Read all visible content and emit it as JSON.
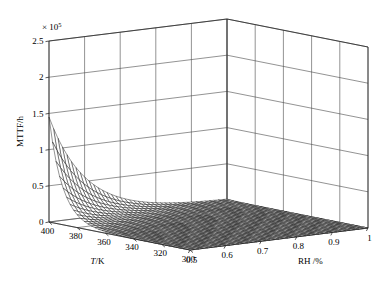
{
  "figure": {
    "title": "",
    "background_color": "#ffffff",
    "width": 382,
    "height": 296
  },
  "axes": {
    "z": {
      "label": "MTTF/h",
      "exponent_label": "× 10",
      "exponent_value": "5",
      "exponent_full": "× 10⁵",
      "ticks": [
        "0",
        "0.5",
        "1",
        "1.5",
        "2",
        "2.5"
      ],
      "tick_values": [
        0,
        0.5,
        1,
        1.5,
        2,
        2.5
      ],
      "range": [
        0,
        2.5
      ],
      "scale_factor": 100000
    },
    "x": {
      "label": "T/K",
      "ticks": [
        "400",
        "380",
        "360",
        "340",
        "320",
        "300"
      ],
      "tick_values": [
        400,
        380,
        360,
        340,
        320,
        300
      ],
      "range": [
        400,
        300
      ]
    },
    "y": {
      "label": "RH /%",
      "ticks": [
        "0.5",
        "0.6",
        "0.7",
        "0.8",
        "0.9",
        "1"
      ],
      "tick_values": [
        0.5,
        0.6,
        0.7,
        0.8,
        0.9,
        1
      ],
      "range": [
        0.5,
        1
      ]
    }
  },
  "chart_data": {
    "type": "surface",
    "title": "",
    "xlabel": "T/K",
    "ylabel": "RH /%",
    "zlabel": "MTTF/h",
    "xlim": [
      400,
      300
    ],
    "ylim": [
      0.5,
      1
    ],
    "zlim": [
      0,
      250000
    ],
    "z_exponent": 100000,
    "grid": true,
    "legend": null,
    "mesh_color": "#000000",
    "surface_style": "wireframe-mesh",
    "x": [
      400,
      395,
      390,
      385,
      380,
      375,
      370,
      365,
      360,
      355,
      350,
      345,
      340,
      335,
      330,
      325,
      320,
      315,
      310,
      305,
      300
    ],
    "y": [
      0.5,
      0.525,
      0.55,
      0.575,
      0.6,
      0.625,
      0.65,
      0.675,
      0.7,
      0.725,
      0.75,
      0.775,
      0.8,
      0.825,
      0.85,
      0.875,
      0.9,
      0.925,
      0.95,
      0.975,
      1.0
    ],
    "peak": {
      "x": 400,
      "y": 0.5,
      "z": 145000,
      "z_scaled": 1.45,
      "note": "Sharp peak near T = 400 K, RH = 0.5"
    },
    "model": {
      "form": "MTTF = A * exp(Ea/(k*T)) * RH^(-n) adapted; decays sharply with increasing RH and decreasing T",
      "A": 145000,
      "rh_decay": 9.5,
      "t_decay": 0.105
    },
    "z_surface_note": "Surface rises to ~1.45e5 at the T=400 K / RH=0.5 corner and decays toward near zero across the rest of the domain",
    "values_sample": [
      {
        "T": 400,
        "RH": 0.5,
        "MTTF": 145000
      },
      {
        "T": 400,
        "RH": 0.6,
        "MTTF": 56000
      },
      {
        "T": 400,
        "RH": 0.7,
        "MTTF": 21500
      },
      {
        "T": 400,
        "RH": 0.8,
        "MTTF": 8300
      },
      {
        "T": 400,
        "RH": 0.9,
        "MTTF": 3200
      },
      {
        "T": 400,
        "RH": 1.0,
        "MTTF": 1250
      },
      {
        "T": 380,
        "RH": 0.5,
        "MTTF": 17700
      },
      {
        "T": 360,
        "RH": 0.5,
        "MTTF": 2170
      },
      {
        "T": 340,
        "RH": 0.5,
        "MTTF": 265
      },
      {
        "T": 320,
        "RH": 0.5,
        "MTTF": 32
      },
      {
        "T": 300,
        "RH": 0.5,
        "MTTF": 4
      }
    ]
  },
  "projection": {
    "origin_x": 190.0,
    "origin_y": 250.0,
    "x_axis_vec": [
      -141.0,
      -28.0
    ],
    "y_axis_vec": [
      178.0,
      -22.0
    ],
    "z_axis_len": 181.0,
    "note": "isometric-like MATLAB default view"
  }
}
